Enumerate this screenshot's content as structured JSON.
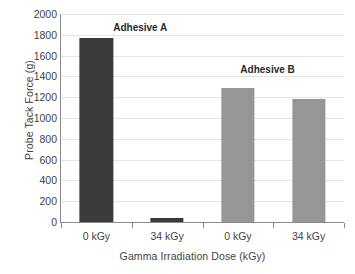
{
  "chart_data": {
    "type": "bar",
    "title": "",
    "xlabel": "Gamma Irradiation Dose (kGy)",
    "ylabel": "Probe Tack Force (g)",
    "categories": [
      "0 kGy",
      "34 kGy",
      "0 kGy",
      "34 kGy"
    ],
    "values": [
      1770,
      40,
      1285,
      1180
    ],
    "bar_colors": [
      "#3a3a3a",
      "#3a3a3a",
      "#969696",
      "#969696"
    ],
    "ylim": [
      0,
      2000
    ],
    "ytick_labels": [
      "0",
      "200",
      "400",
      "600",
      "800",
      "1000",
      "1200",
      "1400",
      "1600",
      "1800",
      "2000"
    ],
    "yticks": [
      0,
      200,
      400,
      600,
      800,
      1000,
      1200,
      1400,
      1600,
      1800,
      2000
    ],
    "grid": true,
    "grid_axis": "y",
    "legend": "none",
    "annotations": [
      {
        "text": "Adhesive A",
        "left_pct": 3,
        "top_pct": 4,
        "width_pct": 50
      },
      {
        "text": "Adhesive B",
        "left_pct": 48,
        "top_pct": 24,
        "width_pct": 50
      }
    ],
    "colors": {
      "series_a": "#3a3a3a",
      "series_b": "#969696",
      "gridline": "#e4e4e4",
      "axis": "#8a8a8a",
      "text": "#3f3f3f",
      "background": "#ffffff"
    }
  }
}
